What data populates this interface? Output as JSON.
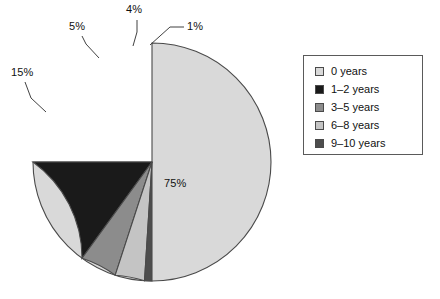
{
  "chart_data": {
    "type": "pie",
    "title": "",
    "categories": [
      "0 years",
      "1–2 years",
      "3–5 years",
      "6–8 years",
      "9–10 years"
    ],
    "values": [
      75,
      15,
      5,
      4,
      1
    ],
    "value_labels": [
      "75%",
      "15%",
      "5%",
      "4%",
      "1%"
    ],
    "units": "percent",
    "colors": [
      "#d9d9d9",
      "#1a1a1a",
      "#8c8c8c",
      "#c4c4c4",
      "#4d4d4d"
    ],
    "legend_position": "right",
    "grid": false,
    "start_angle_deg": 90,
    "direction": "clockwise",
    "slice_outline_color": "#4a4a4a"
  },
  "labels": {
    "slice_75": "75%",
    "slice_15": "15%",
    "slice_5": "5%",
    "slice_4": "4%",
    "slice_1": "1%"
  },
  "legend": {
    "items": [
      {
        "label": "0 years",
        "color": "#d9d9d9"
      },
      {
        "label": "1–2 years",
        "color": "#1a1a1a"
      },
      {
        "label": "3–5 years",
        "color": "#8c8c8c"
      },
      {
        "label": "6–8 years",
        "color": "#c4c4c4"
      },
      {
        "label": "9–10 years",
        "color": "#4d4d4d"
      }
    ]
  }
}
